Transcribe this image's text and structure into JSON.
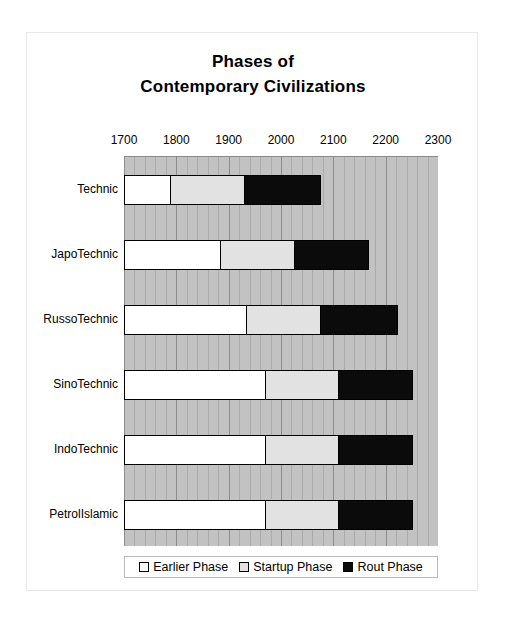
{
  "chart_data": {
    "type": "bar",
    "orientation": "horizontal",
    "stacked": true,
    "title": "Phases of Contemporary Civilizations",
    "title_line1": "Phases of",
    "title_line2": "Contemporary Civilizations",
    "xlabel": "",
    "ylabel": "",
    "xlim": [
      1700,
      2300
    ],
    "xticks": [
      1700,
      1800,
      1900,
      2000,
      2100,
      2200,
      2300
    ],
    "xtick_labels": [
      "1700",
      "1800",
      "1900",
      "2000",
      "2100",
      "2200",
      "2300"
    ],
    "minor_tick_interval": 20,
    "grid": true,
    "legend_position": "bottom",
    "plot_background": "#c2c2c2",
    "categories": [
      "Technic",
      "JapoTechnic",
      "RussoTechnic",
      "SinoTechnic",
      "IndoTechnic",
      "PetrolIslamic"
    ],
    "series": [
      {
        "name": "Earlier Phase",
        "color": "#ffffff",
        "start_values": [
          1700,
          1700,
          1700,
          1700,
          1700,
          1700
        ],
        "end_values": [
          1786,
          1883,
          1933,
          1969,
          1969,
          1969
        ]
      },
      {
        "name": "Startup Phase",
        "color": "#e2e2e2",
        "start_values": [
          1786,
          1883,
          1933,
          1969,
          1969,
          1969
        ],
        "end_values": [
          1929,
          2025,
          2076,
          2110,
          2110,
          2110
        ]
      },
      {
        "name": "Rout Phase",
        "color": "#0b0b0b",
        "start_values": [
          1929,
          2025,
          2076,
          2110,
          2110,
          2110
        ],
        "end_values": [
          2076,
          2168,
          2223,
          2252,
          2252,
          2252
        ]
      }
    ]
  },
  "legend": {
    "items": [
      {
        "label": "Earlier Phase",
        "swatch": "earlier"
      },
      {
        "label": "Startup Phase",
        "swatch": "startup"
      },
      {
        "label": "Rout Phase",
        "swatch": "rout"
      }
    ]
  }
}
